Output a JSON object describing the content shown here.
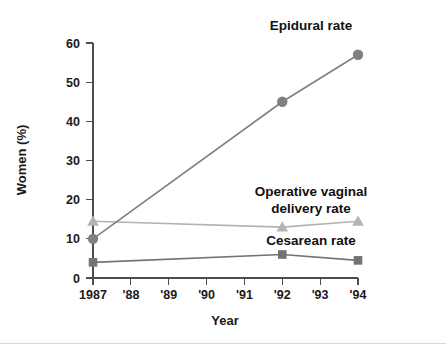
{
  "figure": {
    "background_color": "#ffffff",
    "footer_rule_color": "#d8d8d8"
  },
  "axes": {
    "x_title": "Year",
    "y_title": "Women (%)",
    "x_tick_labels": [
      "1987",
      "'88",
      "'89",
      "'90",
      "'91",
      "'92",
      "'93",
      "'94"
    ],
    "y_tick_labels": [
      "0",
      "10",
      "20",
      "30",
      "40",
      "50",
      "60"
    ],
    "axis_color": "#4d4d4d"
  },
  "annotations": {
    "epidural": "Epidural rate",
    "operative_line1": "Operative vaginal",
    "operative_line2": "delivery rate",
    "cesarean": "Cesarean rate"
  },
  "chart_data": {
    "type": "line",
    "title": "",
    "xlabel": "Year",
    "ylabel": "Women (%)",
    "xlim": [
      1987,
      1994
    ],
    "ylim": [
      0,
      60
    ],
    "x_ticks": [
      1987,
      1988,
      1989,
      1990,
      1991,
      1992,
      1993,
      1994
    ],
    "x_tick_labels": [
      "1987",
      "'88",
      "'89",
      "'90",
      "'91",
      "'92",
      "'93",
      "'94"
    ],
    "y_ticks": [
      0,
      10,
      20,
      30,
      40,
      50,
      60
    ],
    "grid": false,
    "legend": "inline-annotations",
    "series": [
      {
        "name": "Epidural rate",
        "marker": "circle",
        "color": "#808080",
        "x": [
          1987,
          1992,
          1994
        ],
        "values": [
          10,
          45,
          57
        ]
      },
      {
        "name": "Operative vaginal delivery rate",
        "marker": "triangle",
        "color": "#b3b3b3",
        "x": [
          1987,
          1992,
          1994
        ],
        "values": [
          14.5,
          13,
          14.5
        ]
      },
      {
        "name": "Cesarean rate",
        "marker": "square",
        "color": "#737373",
        "x": [
          1987,
          1992,
          1994
        ],
        "values": [
          4,
          6,
          4.5
        ]
      }
    ]
  }
}
